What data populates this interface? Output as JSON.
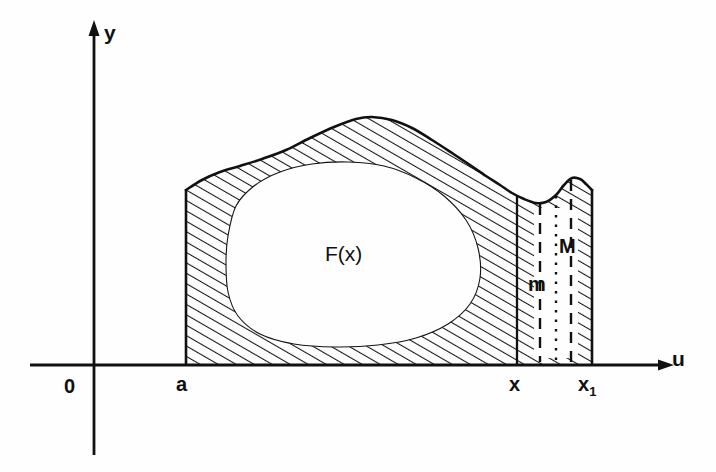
{
  "figure": {
    "background_color": "#fefefe",
    "ink_color": "#111111"
  },
  "axes": {
    "y_axis_label": "y",
    "u_axis_label": "u",
    "origin_label": "0",
    "x_axis": {
      "y_px": 365,
      "x_start_px": 30,
      "x_end_px": 668
    },
    "y_axis": {
      "x_px": 94,
      "y_top_px": 26,
      "y_bottom_px": 455
    }
  },
  "ticks": [
    {
      "name": "a",
      "label": "a",
      "sub": "",
      "x_px": 186
    },
    {
      "name": "x",
      "label": "x",
      "sub": "",
      "x_px": 517
    },
    {
      "name": "x1",
      "label": "x",
      "sub": "1",
      "x_px": 592
    }
  ],
  "labels": {
    "area_label": "F(x)",
    "min_label": "m",
    "max_label": "M"
  },
  "chart_data": {
    "type": "area",
    "xlabel": "u",
    "ylabel": "y",
    "grid": false,
    "legend": null,
    "axis_origin_label": "0",
    "annotations": [
      {
        "text": "F(x)",
        "x_px": 348,
        "y_px": 254,
        "meaning": "shaded area from a to x"
      },
      {
        "text": "m",
        "x_px": 534,
        "y_px": 282,
        "meaning": "minimum ordinate on [x, x1]"
      },
      {
        "text": "M",
        "x_px": 566,
        "y_px": 244,
        "meaning": "maximum ordinate on [x, x1]"
      },
      {
        "text": "a",
        "x_px": 182,
        "y_px": 385,
        "meaning": "lower limit of integration"
      },
      {
        "text": "x",
        "x_px": 515,
        "y_px": 385,
        "meaning": "variable upper limit"
      },
      {
        "text": "x1",
        "x_px": 588,
        "y_px": 385,
        "meaning": "shifted upper limit x + h"
      }
    ],
    "boundaries": {
      "left_ordinate_x_px": 186,
      "right_ordinate_x_px": 592,
      "strip_left_x_px": 517,
      "strip_right_x_px": 592,
      "baseline_y_px": 365
    },
    "curve_points_px": [
      [
        186,
        190
      ],
      [
        202,
        180
      ],
      [
        220,
        172
      ],
      [
        240,
        166
      ],
      [
        262,
        159
      ],
      [
        286,
        150
      ],
      [
        310,
        138
      ],
      [
        334,
        127
      ],
      [
        356,
        119
      ],
      [
        372,
        117
      ],
      [
        392,
        120
      ],
      [
        412,
        128
      ],
      [
        432,
        140
      ],
      [
        452,
        153
      ],
      [
        470,
        165
      ],
      [
        486,
        176
      ],
      [
        500,
        185
      ],
      [
        512,
        193
      ],
      [
        524,
        199
      ],
      [
        536,
        203
      ],
      [
        546,
        202
      ],
      [
        556,
        195
      ],
      [
        564,
        185
      ],
      [
        572,
        178
      ],
      [
        580,
        179
      ],
      [
        586,
        184
      ],
      [
        592,
        190
      ]
    ],
    "inner_void_points_px": [
      [
        228,
        236
      ],
      [
        236,
        206
      ],
      [
        254,
        186
      ],
      [
        280,
        172
      ],
      [
        312,
        164
      ],
      [
        348,
        162
      ],
      [
        384,
        166
      ],
      [
        416,
        178
      ],
      [
        444,
        196
      ],
      [
        466,
        220
      ],
      [
        478,
        248
      ],
      [
        480,
        278
      ],
      [
        470,
        304
      ],
      [
        448,
        324
      ],
      [
        416,
        338
      ],
      [
        378,
        345
      ],
      [
        336,
        347
      ],
      [
        294,
        344
      ],
      [
        260,
        334
      ],
      [
        238,
        316
      ],
      [
        228,
        292
      ],
      [
        226,
        262
      ]
    ],
    "strip_inner_void_px": {
      "x0": 534,
      "x1": 578,
      "y_top": 208,
      "y_bottom": 358
    },
    "vertical_lines": [
      {
        "name": "min-ordinate-line",
        "x_px": 540,
        "y_top_px": 204,
        "y_bottom_px": 362,
        "style": "dashed"
      },
      {
        "name": "mid-ordinate-line",
        "x_px": 556,
        "y_top_px": 196,
        "y_bottom_px": 362,
        "style": "dotted"
      },
      {
        "name": "max-ordinate-line",
        "x_px": 571,
        "y_top_px": 180,
        "y_bottom_px": 362,
        "style": "dashed"
      }
    ],
    "hatching": {
      "angle_deg": 60,
      "spacing_px": 9,
      "color": "#111111",
      "description": "diagonal hatch band between the curve and the baseline, white elliptical void in the interior"
    }
  }
}
